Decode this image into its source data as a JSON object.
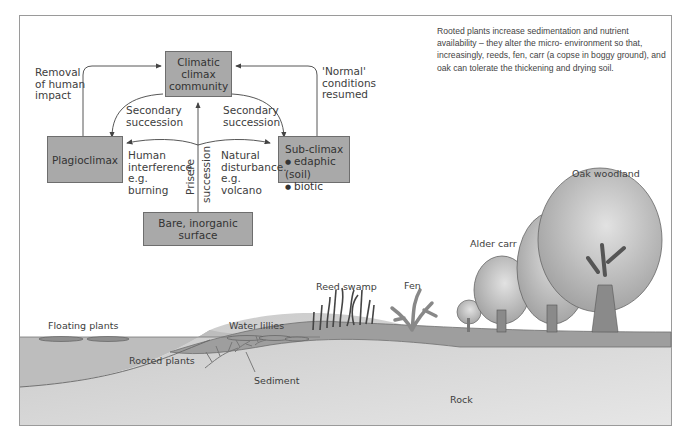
{
  "diagram": {
    "type": "ecological-succession",
    "boxes": {
      "climax": "Climatic\nclimax\ncommunity",
      "plagioclimax": "Plagioclimax",
      "subclimax_title": "Sub-climax",
      "subclimax_items": [
        "edaphic (soil)",
        "biotic"
      ],
      "bare": "Bare, inorganic surface"
    },
    "labels": {
      "removal": "Removal\nof human\nimpact",
      "normal": "'Normal'\nconditions\nresumed",
      "secondary_left": "Secondary\nsuccession",
      "secondary_right": "Secondary\nsuccession",
      "human": "Human\ninterference.\ne.g.\nburning",
      "natural": "Natural\ndisturbance.\ne.g.\nvolcano",
      "prisere_1": "Prisere",
      "prisere_2": "succession"
    },
    "note": "Rooted plants increase sedimentation and nutrient availability – they alter the micro- environment so that, increasingly, reeds, fen, carr (a copse in boggy ground), and oak can tolerate the thickening and drying soil.",
    "scene_labels": {
      "floating": "Floating plants",
      "lillies": "Water lillies",
      "rooted": "Rooted plants",
      "sediment": "Sediment",
      "reed": "Reed swamp",
      "fen": "Fen",
      "alder": "Alder carr",
      "oak": "Oak woodland",
      "rock": "Rock"
    },
    "colors": {
      "box_fill": "#a9a9a9",
      "water": "#bdbdbd",
      "sediment": "#9e9e9e",
      "rock": "#d4d4d4",
      "tree": "#b5b5b5"
    }
  }
}
